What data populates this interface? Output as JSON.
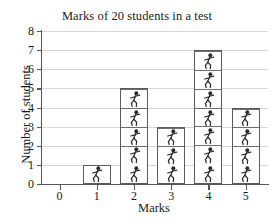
{
  "chart_data": {
    "type": "bar",
    "title": "Marks of 20 students in a test",
    "xlabel": "Marks",
    "ylabel": "Number of students",
    "categories": [
      "0",
      "1",
      "2",
      "3",
      "4",
      "5"
    ],
    "values": [
      0,
      1,
      5,
      3,
      7,
      4
    ],
    "xlim": [
      -0.5,
      5.6
    ],
    "ylim": [
      0,
      8
    ],
    "x_ticks": [
      "0",
      "1",
      "2",
      "3",
      "4",
      "5"
    ],
    "y_ticks": [
      "0",
      "1",
      "2",
      "3",
      "4",
      "5",
      "6",
      "7",
      "8"
    ],
    "grid": "horizontal",
    "legend": "none",
    "bar_style": "pictogram-stacked-unit-squares",
    "unit_icon": "person-figure-icon",
    "total_students": 20,
    "colors": {
      "background": "#ffffff",
      "bar_fill": "#ffffff",
      "bar_border": "#5c5c5c",
      "gridline": "#d6d6d6",
      "axis": "#555555",
      "text": "#1a1a1a"
    }
  }
}
